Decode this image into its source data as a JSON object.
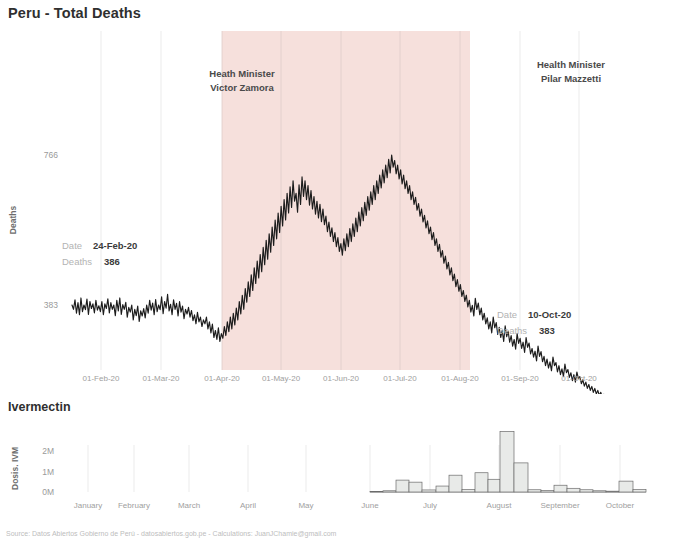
{
  "page": {
    "title": "Peru - Total Deaths",
    "subtitle": "Ivermectin",
    "footer": "Source: Datos Abiertos Gobierno de Perú - datosabiertos.gob.pe  -  Calculations: JuanJChamie@gmail.com"
  },
  "colors": {
    "shade_band": "#f6e0dc",
    "line": "#1c1c1c",
    "bar_fill": "#e8eae8",
    "bar_stroke": "#6b6b6b",
    "grid": "#e6e6e6",
    "axis_text": "#a0a0a0",
    "tooltip_label": "#b3b3b3",
    "tooltip_value": "#3b3b3b"
  },
  "annotations": [
    {
      "name": "minister-zamora",
      "line1": "Heath Minister",
      "line2": "Victor Zamora",
      "x": 242,
      "y": 77
    },
    {
      "name": "minister-mazzetti",
      "line1": "Health Minister",
      "line2": "Pilar Mazzetti",
      "x": 571,
      "y": 68
    }
  ],
  "tooltips": [
    {
      "name": "tooltip-left",
      "date_label": "Date",
      "date_value": "24-Feb-20",
      "deaths_label": "Deaths",
      "deaths_value": "386",
      "x": 62,
      "y": 249
    },
    {
      "name": "tooltip-right",
      "date_label": "Date",
      "date_value": "10-Oct-20",
      "deaths_label": "Deaths",
      "deaths_value": "383",
      "x": 497,
      "y": 318
    }
  ],
  "shaded_period": {
    "label": "Victor Zamora tenure",
    "x_start": 222,
    "x_end": 470
  },
  "chart_data": [
    {
      "type": "line",
      "name": "deaths-chart",
      "title": "Peru - Total Deaths",
      "xlabel": "",
      "ylabel": "Deaths",
      "ylim": [
        0,
        800
      ],
      "yticks": [
        383,
        766
      ],
      "ytick_labels": [
        "383",
        "766"
      ],
      "grid": true,
      "x_tick_labels": [
        "01-Feb-20",
        "01-Mar-20",
        "01-Apr-20",
        "01-May-20",
        "01-Jun-20",
        "01-Jul-20",
        "01-Aug-20",
        "01-Sep-20",
        "01-Oct-20"
      ],
      "x_tick_positions": [
        101,
        161,
        222,
        281,
        341,
        400,
        460,
        520,
        579
      ],
      "x_start_date": "10-Jan-20",
      "x_end_date": "10-Oct-20",
      "values": [
        383,
        372,
        396,
        362,
        389,
        358,
        401,
        366,
        383,
        371,
        398,
        359,
        392,
        374,
        386,
        363,
        395,
        370,
        381,
        366,
        392,
        358,
        386,
        374,
        399,
        363,
        389,
        372,
        383,
        356,
        395,
        368,
        401,
        359,
        384,
        372,
        390,
        352,
        377,
        365,
        383,
        345,
        372,
        356,
        380,
        341,
        368,
        355,
        374,
        350,
        383,
        362,
        395,
        370,
        388,
        358,
        397,
        366,
        383,
        371,
        404,
        361,
        392,
        375,
        410,
        368,
        385,
        358,
        396,
        372,
        387,
        355,
        392,
        365,
        380,
        348,
        372,
        360,
        377,
        352,
        369,
        343,
        358,
        335,
        364,
        340,
        352,
        328,
        345,
        335,
        352,
        322,
        340,
        312,
        334,
        300,
        318,
        295,
        325,
        290,
        310,
        298,
        328,
        305,
        340,
        315,
        352,
        322,
        362,
        332,
        375,
        345,
        392,
        360,
        408,
        372,
        425,
        390,
        442,
        405,
        460,
        420,
        478,
        438,
        495,
        452,
        512,
        468,
        530,
        486,
        548,
        500,
        565,
        518,
        582,
        535,
        600,
        552,
        618,
        568,
        635,
        585,
        652,
        600,
        668,
        618,
        685,
        632,
        700,
        648,
        668,
        620,
        690,
        640,
        710,
        660,
        700,
        652,
        688,
        638,
        675,
        628,
        660,
        615,
        648,
        605,
        640,
        596,
        628,
        588,
        610,
        570,
        595,
        558,
        580,
        545,
        568,
        532,
        555,
        520,
        540,
        510,
        552,
        522,
        565,
        532,
        578,
        545,
        590,
        558,
        605,
        570,
        620,
        585,
        632,
        598,
        645,
        612,
        660,
        625,
        672,
        640,
        688,
        652,
        700,
        668,
        715,
        682,
        728,
        695,
        740,
        708,
        755,
        720,
        766,
        735,
        752,
        718,
        740,
        705,
        728,
        692,
        715,
        680,
        700,
        668,
        688,
        652,
        672,
        640,
        658,
        625,
        642,
        610,
        628,
        595,
        612,
        580,
        598,
        565,
        582,
        550,
        568,
        535,
        552,
        520,
        538,
        505,
        522,
        490,
        508,
        475,
        492,
        460,
        478,
        445,
        462,
        430,
        448,
        418,
        435,
        405,
        420,
        392,
        408,
        378,
        395,
        365,
        382,
        355,
        400,
        372,
        388,
        358,
        375,
        345,
        362,
        335,
        350,
        322,
        340,
        312,
        352,
        325,
        338,
        308,
        326,
        300,
        318,
        290,
        330,
        302,
        316,
        288,
        305,
        278,
        295,
        270,
        310,
        285,
        298,
        272,
        288,
        262,
        300,
        275,
        286,
        258,
        272,
        250,
        265,
        240,
        278,
        252,
        264,
        238,
        252,
        228,
        245,
        222,
        238,
        215,
        250,
        228,
        236,
        212,
        228,
        205,
        220,
        200,
        232,
        210,
        218,
        198,
        210,
        190,
        205,
        186,
        212,
        195,
        200,
        182,
        192,
        176,
        186,
        170,
        180,
        165,
        175,
        160,
        170,
        156,
        165,
        152,
        160,
        148,
        155,
        145,
        152,
        142,
        150,
        140,
        148,
        138,
        145,
        136,
        143,
        134,
        140,
        132,
        138,
        130,
        136,
        128,
        134,
        126,
        132,
        124,
        130,
        122,
        128,
        120,
        126,
        118,
        124,
        116,
        122,
        114,
        120,
        112,
        118,
        110,
        116,
        108,
        114,
        106,
        112,
        104,
        110,
        102
      ]
    },
    {
      "type": "bar",
      "name": "ivermectin-chart",
      "title": "Ivermectin",
      "xlabel": "",
      "ylabel": "Dosis. IVM",
      "ylim": [
        0,
        3000000
      ],
      "ytick_labels": [
        "0M",
        "1M",
        "2M"
      ],
      "ytick_values": [
        0,
        1000000,
        2000000
      ],
      "x_tick_labels": [
        "January",
        "February",
        "March",
        "April",
        "May",
        "June",
        "July",
        "August",
        "September",
        "October"
      ],
      "x_tick_positions": [
        88,
        134,
        189,
        248,
        306,
        370,
        430,
        499,
        560,
        620
      ],
      "bars": [
        {
          "x": 370,
          "w": 13,
          "value": 0
        },
        {
          "x": 383,
          "w": 13,
          "value": 60000
        },
        {
          "x": 396,
          "w": 13,
          "value": 580000
        },
        {
          "x": 409,
          "w": 13,
          "value": 480000
        },
        {
          "x": 422,
          "w": 14,
          "value": 100000
        },
        {
          "x": 436,
          "w": 13,
          "value": 290000
        },
        {
          "x": 449,
          "w": 13,
          "value": 820000
        },
        {
          "x": 462,
          "w": 13,
          "value": 120000
        },
        {
          "x": 475,
          "w": 13,
          "value": 940000
        },
        {
          "x": 488,
          "w": 12,
          "value": 620000
        },
        {
          "x": 500,
          "w": 14,
          "value": 2950000
        },
        {
          "x": 514,
          "w": 14,
          "value": 1420000
        },
        {
          "x": 528,
          "w": 13,
          "value": 110000
        },
        {
          "x": 541,
          "w": 13,
          "value": 70000
        },
        {
          "x": 554,
          "w": 13,
          "value": 330000
        },
        {
          "x": 567,
          "w": 13,
          "value": 180000
        },
        {
          "x": 580,
          "w": 13,
          "value": 110000
        },
        {
          "x": 593,
          "w": 13,
          "value": 60000
        },
        {
          "x": 606,
          "w": 13,
          "value": 40000
        },
        {
          "x": 619,
          "w": 14,
          "value": 530000
        },
        {
          "x": 633,
          "w": 13,
          "value": 120000
        }
      ],
      "grid": true
    }
  ]
}
